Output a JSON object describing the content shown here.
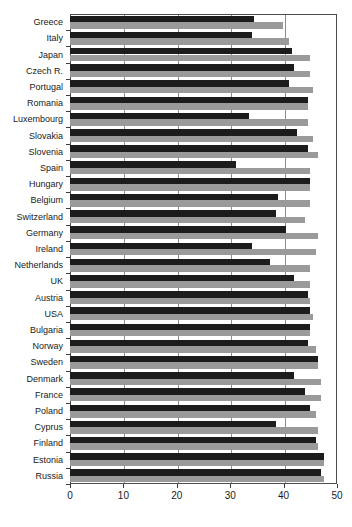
{
  "chart_data": {
    "type": "bar",
    "orientation": "horizontal",
    "title": "",
    "subtitle": "",
    "xlabel": "",
    "ylabel": "",
    "xlim": [
      0,
      50
    ],
    "ylim": null,
    "grid": true,
    "legend_position": "none",
    "xticks": [
      0,
      10,
      20,
      30,
      40,
      50
    ],
    "xtick_labels": [
      "0",
      "10",
      "20",
      "30",
      "40",
      "50"
    ],
    "categories": [
      "Greece",
      "Italy",
      "Japan",
      "Czech R.",
      "Portugal",
      "Romania",
      "Luxembourg",
      "Slovakia",
      "Slovenia",
      "Spain",
      "Hungary",
      "Belgium",
      "Switzerland",
      "Germany",
      "Ireland",
      "Netherlands",
      "UK",
      "Austria",
      "USA",
      "Bulgaria",
      "Norway",
      "Sweden",
      "Denmark",
      "France",
      "Poland",
      "Cyprus",
      "Finland",
      "Estonia",
      "Russia"
    ],
    "series": [
      {
        "name": "series-dark",
        "color": "#1c1c1c",
        "values": [
          34.5,
          34.0,
          41.5,
          42.0,
          41.0,
          44.5,
          33.5,
          42.5,
          44.5,
          31.0,
          45.0,
          39.0,
          38.5,
          40.5,
          34.0,
          37.5,
          42.0,
          44.5,
          45.0,
          45.0,
          44.5,
          46.5,
          42.0,
          44.0,
          45.0,
          38.5,
          46.0,
          47.5,
          47.0
        ]
      },
      {
        "name": "series-light",
        "color": "#9a9a9a",
        "values": [
          39.8,
          41.0,
          45.0,
          45.0,
          45.5,
          44.5,
          44.5,
          45.5,
          46.5,
          45.0,
          45.0,
          45.0,
          44.0,
          46.5,
          46.0,
          45.0,
          45.0,
          45.0,
          45.5,
          45.0,
          46.0,
          46.5,
          47.0,
          47.0,
          46.0,
          46.5,
          46.5,
          47.5,
          47.5
        ]
      }
    ]
  },
  "axis": {
    "x_min_label": "0",
    "x_max_label": "50"
  },
  "caption": {
    "text": ""
  }
}
